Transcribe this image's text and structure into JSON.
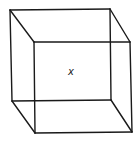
{
  "diagram": {
    "type": "wireframe-cube",
    "label": "x",
    "colors": {
      "stroke": "#1a1a1a",
      "background": "#ffffff",
      "label": "#222222"
    },
    "vertices": {
      "back_top_left": [
        10,
        10
      ],
      "back_top_right": [
        110,
        9
      ],
      "back_bottom_left": [
        12,
        101
      ],
      "back_bottom_right": [
        111,
        100
      ],
      "front_top_left": [
        34,
        42
      ],
      "front_top_right": [
        130,
        42
      ],
      "front_bottom_left": [
        35,
        133
      ],
      "front_bottom_right": [
        132,
        132
      ]
    },
    "label_position": [
      71,
      75
    ]
  }
}
